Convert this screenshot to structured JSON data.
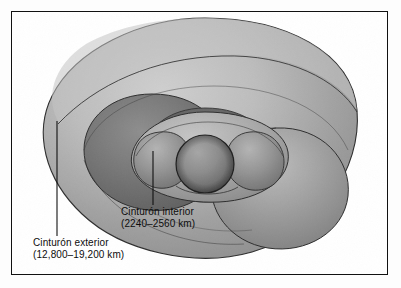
{
  "figure": {
    "kind": "scientific-illustration",
    "style": "grayscale halftone drawing",
    "frame": {
      "border_color": "#111111",
      "background_color": "#ffffff"
    }
  },
  "labels": {
    "inner_belt": {
      "name": "Cinturón interior",
      "range": "(2240–2560 km)"
    },
    "outer_belt": {
      "name": "Cinturón exterior",
      "range": "(12,800–19,200 km)"
    }
  },
  "leaders": {
    "inner_belt_line": "leader-line-inner-belt",
    "outer_belt_line": "leader-line-outer-belt"
  },
  "artwork": {
    "earth_sphere": "earth-sphere",
    "inner_torus": "inner-radiation-belt-torus",
    "outer_torus": "outer-radiation-belt-torus",
    "palette": {
      "light_gray": "#c9c9c9",
      "mid_gray": "#a3a3a3",
      "dark_gray": "#6e6e6e",
      "deep_gray": "#4a4a4a",
      "outline": "#2b2b2b"
    }
  }
}
